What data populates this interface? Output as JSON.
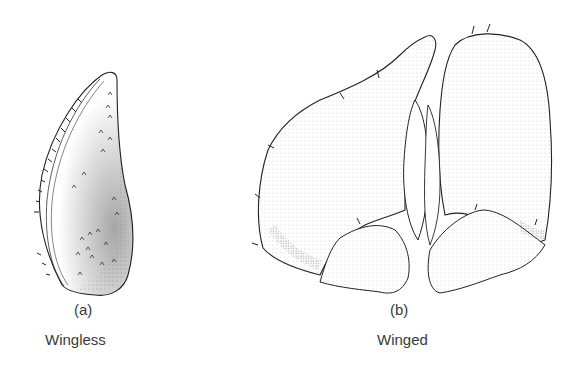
{
  "figures": [
    {
      "id": "a",
      "marker": "(a)",
      "caption": "Wingless"
    },
    {
      "id": "b",
      "marker": "(b)",
      "caption": "Winged"
    }
  ]
}
